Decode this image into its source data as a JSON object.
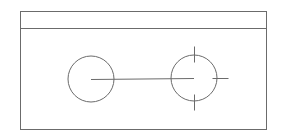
{
  "diagram": {
    "type": "technical-line-drawing",
    "stroke_color": "#6b6b6b",
    "background": "#ffffff",
    "frame": {
      "x": 20,
      "y": 11,
      "width": 246,
      "height": 118,
      "header_divider_y": 28
    },
    "circles": [
      {
        "id": "left-circle",
        "cx": 91,
        "cy": 79,
        "r": 23,
        "ticks": []
      },
      {
        "id": "right-circle",
        "cx": 194,
        "cy": 78,
        "r": 23,
        "ticks": [
          {
            "id": "tick-top",
            "x1": 194,
            "y1": 46,
            "x2": 194,
            "y2": 62
          },
          {
            "id": "tick-bottom",
            "x1": 194,
            "y1": 94,
            "x2": 194,
            "y2": 110
          },
          {
            "id": "tick-right",
            "x1": 212,
            "y1": 78,
            "x2": 228,
            "y2": 78
          }
        ]
      }
    ],
    "connector": {
      "x1": 91,
      "y1": 79,
      "x2": 194,
      "y2": 78
    }
  }
}
